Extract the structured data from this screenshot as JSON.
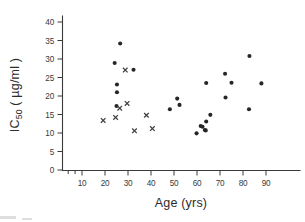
{
  "figure": {
    "background_color": "#ffffff",
    "ink_color": "#2b2b2b",
    "marker_circle_color": "#262626",
    "marker_cross_color": "#3f3f3f"
  },
  "chart_data": {
    "type": "scatter",
    "title": "",
    "xlabel": "Age (yrs)",
    "ylabel": "IC 50 ( µg/ml )",
    "ylabel_main": "IC",
    "ylabel_sub": "50",
    "ylabel_units": "( µg/ml )",
    "xlim": [
      0,
      95
    ],
    "ylim": [
      0,
      43
    ],
    "xticks": [
      10,
      20,
      30,
      40,
      50,
      60,
      70,
      80,
      90
    ],
    "xticklabels": [
      "10",
      "20",
      "30",
      "40",
      "50",
      "60",
      "70",
      "80",
      "90"
    ],
    "yticks": [
      0,
      5,
      10,
      15,
      20,
      25,
      30,
      35,
      40
    ],
    "yticklabels": [
      "0",
      "5",
      "10",
      "15",
      "20",
      "25",
      "30",
      "35",
      "40"
    ],
    "grid": false,
    "legend": "none",
    "series": [
      {
        "name": "filled-circle",
        "marker": "circle",
        "color": "#262626",
        "points": [
          {
            "x": 24.2,
            "y": 28.9
          },
          {
            "x": 26.6,
            "y": 34.2
          },
          {
            "x": 25.2,
            "y": 23.1
          },
          {
            "x": 25.2,
            "y": 21.0
          },
          {
            "x": 25.0,
            "y": 17.3
          },
          {
            "x": 32.4,
            "y": 27.1
          },
          {
            "x": 48.2,
            "y": 16.4
          },
          {
            "x": 51.4,
            "y": 19.3
          },
          {
            "x": 52.4,
            "y": 17.6
          },
          {
            "x": 59.8,
            "y": 9.9
          },
          {
            "x": 61.6,
            "y": 11.9
          },
          {
            "x": 62.4,
            "y": 11.7
          },
          {
            "x": 63.4,
            "y": 10.8
          },
          {
            "x": 64.0,
            "y": 13.1
          },
          {
            "x": 63.8,
            "y": 10.7
          },
          {
            "x": 65.8,
            "y": 14.9
          },
          {
            "x": 64.0,
            "y": 23.5
          },
          {
            "x": 72.2,
            "y": 26.0
          },
          {
            "x": 72.4,
            "y": 19.6
          },
          {
            "x": 75.0,
            "y": 23.6
          },
          {
            "x": 82.8,
            "y": 30.8
          },
          {
            "x": 82.6,
            "y": 16.4
          },
          {
            "x": 88.0,
            "y": 23.4
          }
        ]
      },
      {
        "name": "cross",
        "marker": "x",
        "color": "#3f3f3f",
        "points": [
          {
            "x": 19.2,
            "y": 13.4
          },
          {
            "x": 24.6,
            "y": 14.2
          },
          {
            "x": 26.4,
            "y": 16.7
          },
          {
            "x": 28.8,
            "y": 27.0
          },
          {
            "x": 29.6,
            "y": 18.0
          },
          {
            "x": 32.8,
            "y": 10.6
          },
          {
            "x": 38.0,
            "y": 14.8
          },
          {
            "x": 40.6,
            "y": 11.2
          }
        ]
      }
    ]
  },
  "axes_geometry": {
    "note": "pixel mapping used to place marks",
    "x_pixel_at_10": 82,
    "x_pixel_per_10yrs": 23,
    "y_pixel_at_0": 170,
    "y_pixel_per_unit": 3.7
  }
}
